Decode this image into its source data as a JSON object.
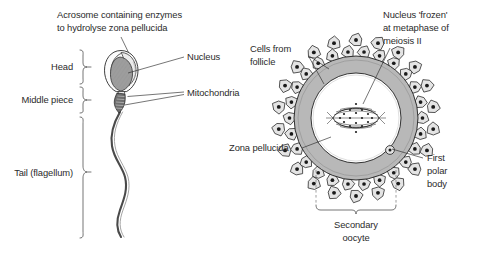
{
  "figure": {
    "background": "#ffffff",
    "text_color": "#2b2b2b"
  },
  "sperm": {
    "name": "sperm-diagram",
    "labels": {
      "acrosome_line1": "Acrosome containing enzymes",
      "acrosome_line2": "to hydrolyse zona pellucida",
      "nucleus": "Nucleus",
      "mitochondria": "Mitochondria",
      "head": "Head",
      "middle_piece": "Middle piece",
      "tail": "Tail (flagellum)"
    },
    "colors": {
      "acrosome_fill": "#f2f2f2",
      "nucleus_fill": "#9a9a9a",
      "midpiece_fill": "#6e6e6e",
      "tail_stroke": "#4a4a4a",
      "outline": "#1f1f1f"
    }
  },
  "oocyte": {
    "name": "oocyte-diagram",
    "labels": {
      "nucleus_line1": "Nucleus 'frozen'",
      "nucleus_line2": "at metaphase of",
      "nucleus_line3": "meiosis II",
      "cells_line1": "Cells from",
      "cells_line2": "follicle",
      "zona_pellucida": "Zona pellucida",
      "polar_line1": "First",
      "polar_line2": "polar",
      "polar_line3": "body",
      "secondary_line1": "Secondary",
      "secondary_line2": "oocyte"
    },
    "colors": {
      "zona_fill": "#b8b8b8",
      "ooplasm_fill": "#ffffff",
      "follicle_fill": "#e4e4e4",
      "follicle_nucleus": "#1a1a1a",
      "spindle_stroke": "#1f1f1f",
      "outline": "#1f1f1f"
    },
    "structure": {
      "follicle_cell_count": 46,
      "zona_outer_radius": 62,
      "zona_inner_radius": 52,
      "spindle_width": 46,
      "spindle_height": 26
    }
  }
}
